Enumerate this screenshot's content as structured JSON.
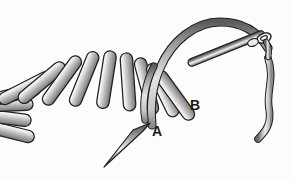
{
  "figure": {
    "background_color": "#fdfdfd",
    "thread_color_light": "#f2f2f2",
    "thread_color_mid": "#9a9a9a",
    "thread_color_dark": "#4a4a4a",
    "outline_color": "#1f1f1f",
    "label_color": "#1a1a1a"
  },
  "labels": [
    {
      "id": "a",
      "text": "A",
      "meaning": "awl-entry-point",
      "x": 152,
      "y": 124
    },
    {
      "id": "b",
      "text": "B",
      "meaning": "needle-exit-point",
      "x": 190,
      "y": 98
    }
  ],
  "elements": {
    "stitch_fan": {
      "name": "stitch-fan",
      "count": 13,
      "description": "Row of elongated rounded stitches radiating around an arc"
    },
    "arched_thread": {
      "name": "arched-working-thread",
      "description": "Looping thread arching from the last stitch up and over to the needle"
    },
    "needle": {
      "name": "threaded-needle",
      "description": "Straight needle with eye at upper right, thread passing through eye"
    },
    "awl": {
      "name": "awl-pointer",
      "description": "Tapered awl pointing toward label A"
    },
    "thread_tail": {
      "name": "thread-tail",
      "description": "Free thread end falling from the needle eye toward lower right"
    }
  },
  "chart_data": {
    "type": "diagram",
    "annotations": [
      "A",
      "B"
    ],
    "stitch_count": 13
  }
}
